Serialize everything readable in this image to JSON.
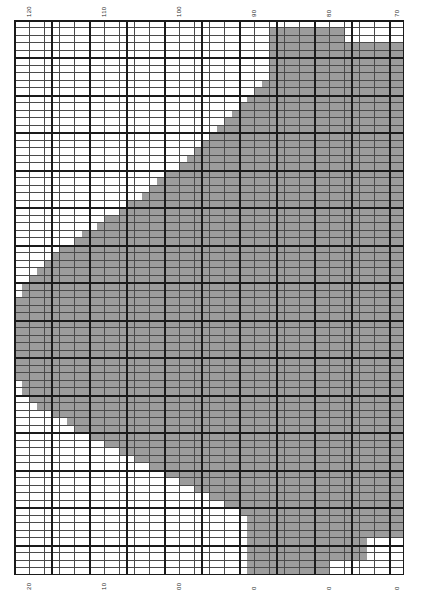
{
  "chart_data": {
    "type": "heatmap",
    "title": "",
    "xlabel": "",
    "ylabel": "",
    "grid": true,
    "legend": false,
    "cell_size_px": 7.5,
    "major_every": 5,
    "columns": 52,
    "rows": 74,
    "fill_color": "#9c9c9c",
    "background_color": "#ffffff",
    "minor_line_color": "#4a4a4a",
    "major_line_color": "#1a1a1a",
    "top_axis": {
      "position": "top",
      "orientation": "vertical",
      "ticks": [
        {
          "label": "120",
          "x_px": 26
        },
        {
          "label": "110",
          "x_px": 101
        },
        {
          "label": "100",
          "x_px": 176
        },
        {
          "label": "90",
          "x_px": 251
        },
        {
          "label": "80",
          "x_px": 326
        },
        {
          "label": "70",
          "x_px": 394
        }
      ]
    },
    "bottom_axis": {
      "position": "bottom",
      "orientation": "vertical",
      "ticks": [
        {
          "label": "20",
          "x_px": 26
        },
        {
          "label": "10",
          "x_px": 101
        },
        {
          "label": "00",
          "x_px": 176
        },
        {
          "label": "0",
          "x_px": 251
        },
        {
          "label": "0",
          "x_px": 326
        },
        {
          "label": "0",
          "x_px": 394
        }
      ]
    },
    "region_rows": [
      {
        "row": 0,
        "spans": []
      },
      {
        "row": 1,
        "spans": [
          [
            34,
            44
          ]
        ]
      },
      {
        "row": 2,
        "spans": [
          [
            34,
            44
          ]
        ]
      },
      {
        "row": 3,
        "spans": [
          [
            34,
            52
          ]
        ]
      },
      {
        "row": 4,
        "spans": [
          [
            34,
            52
          ]
        ]
      },
      {
        "row": 5,
        "spans": [
          [
            34,
            52
          ]
        ]
      },
      {
        "row": 6,
        "spans": [
          [
            34,
            52
          ]
        ]
      },
      {
        "row": 7,
        "spans": [
          [
            34,
            52
          ]
        ]
      },
      {
        "row": 8,
        "spans": [
          [
            33,
            52
          ]
        ]
      },
      {
        "row": 9,
        "spans": [
          [
            32,
            52
          ]
        ]
      },
      {
        "row": 10,
        "spans": [
          [
            31,
            52
          ]
        ]
      },
      {
        "row": 11,
        "spans": [
          [
            30,
            52
          ]
        ]
      },
      {
        "row": 12,
        "spans": [
          [
            29,
            52
          ]
        ]
      },
      {
        "row": 13,
        "spans": [
          [
            28,
            52
          ]
        ]
      },
      {
        "row": 14,
        "spans": [
          [
            27,
            52
          ]
        ]
      },
      {
        "row": 15,
        "spans": [
          [
            26,
            52
          ]
        ]
      },
      {
        "row": 16,
        "spans": [
          [
            25,
            52
          ]
        ]
      },
      {
        "row": 17,
        "spans": [
          [
            24,
            52
          ]
        ]
      },
      {
        "row": 18,
        "spans": [
          [
            23,
            52
          ]
        ]
      },
      {
        "row": 19,
        "spans": [
          [
            22,
            52
          ]
        ]
      },
      {
        "row": 20,
        "spans": [
          [
            20,
            52
          ]
        ]
      },
      {
        "row": 21,
        "spans": [
          [
            19,
            52
          ]
        ]
      },
      {
        "row": 22,
        "spans": [
          [
            18,
            52
          ]
        ]
      },
      {
        "row": 23,
        "spans": [
          [
            17,
            52
          ]
        ]
      },
      {
        "row": 24,
        "spans": [
          [
            15,
            52
          ]
        ]
      },
      {
        "row": 25,
        "spans": [
          [
            14,
            52
          ]
        ]
      },
      {
        "row": 26,
        "spans": [
          [
            12,
            52
          ]
        ]
      },
      {
        "row": 27,
        "spans": [
          [
            11,
            52
          ]
        ]
      },
      {
        "row": 28,
        "spans": [
          [
            9,
            52
          ]
        ]
      },
      {
        "row": 29,
        "spans": [
          [
            8,
            52
          ]
        ]
      },
      {
        "row": 30,
        "spans": [
          [
            6,
            52
          ]
        ]
      },
      {
        "row": 31,
        "spans": [
          [
            5,
            52
          ]
        ]
      },
      {
        "row": 32,
        "spans": [
          [
            4,
            52
          ]
        ]
      },
      {
        "row": 33,
        "spans": [
          [
            3,
            52
          ]
        ]
      },
      {
        "row": 34,
        "spans": [
          [
            2,
            52
          ]
        ]
      },
      {
        "row": 35,
        "spans": [
          [
            1,
            52
          ]
        ]
      },
      {
        "row": 36,
        "spans": [
          [
            1,
            52
          ]
        ]
      },
      {
        "row": 37,
        "spans": [
          [
            0,
            52
          ]
        ]
      },
      {
        "row": 38,
        "spans": [
          [
            0,
            52
          ]
        ]
      },
      {
        "row": 39,
        "spans": [
          [
            0,
            52
          ]
        ]
      },
      {
        "row": 40,
        "spans": [
          [
            0,
            52
          ]
        ]
      },
      {
        "row": 41,
        "spans": [
          [
            0,
            52
          ]
        ]
      },
      {
        "row": 42,
        "spans": [
          [
            0,
            52
          ]
        ]
      },
      {
        "row": 43,
        "spans": [
          [
            0,
            52
          ]
        ]
      },
      {
        "row": 44,
        "spans": [
          [
            0,
            52
          ]
        ]
      },
      {
        "row": 45,
        "spans": [
          [
            0,
            52
          ]
        ]
      },
      {
        "row": 46,
        "spans": [
          [
            0,
            52
          ]
        ]
      },
      {
        "row": 47,
        "spans": [
          [
            0,
            52
          ]
        ]
      },
      {
        "row": 48,
        "spans": [
          [
            1,
            52
          ]
        ]
      },
      {
        "row": 49,
        "spans": [
          [
            1,
            52
          ]
        ]
      },
      {
        "row": 50,
        "spans": [
          [
            2,
            52
          ]
        ]
      },
      {
        "row": 51,
        "spans": [
          [
            3,
            52
          ]
        ]
      },
      {
        "row": 52,
        "spans": [
          [
            5,
            52
          ]
        ]
      },
      {
        "row": 53,
        "spans": [
          [
            7,
            52
          ]
        ]
      },
      {
        "row": 54,
        "spans": [
          [
            8,
            52
          ]
        ]
      },
      {
        "row": 55,
        "spans": [
          [
            10,
            52
          ]
        ]
      },
      {
        "row": 56,
        "spans": [
          [
            12,
            52
          ]
        ]
      },
      {
        "row": 57,
        "spans": [
          [
            14,
            52
          ]
        ]
      },
      {
        "row": 58,
        "spans": [
          [
            16,
            52
          ]
        ]
      },
      {
        "row": 59,
        "spans": [
          [
            18,
            52
          ]
        ]
      },
      {
        "row": 60,
        "spans": [
          [
            20,
            52
          ]
        ]
      },
      {
        "row": 61,
        "spans": [
          [
            22,
            52
          ]
        ]
      },
      {
        "row": 62,
        "spans": [
          [
            24,
            52
          ]
        ]
      },
      {
        "row": 63,
        "spans": [
          [
            26,
            52
          ]
        ]
      },
      {
        "row": 64,
        "spans": [
          [
            28,
            52
          ]
        ]
      },
      {
        "row": 65,
        "spans": [
          [
            30,
            52
          ]
        ]
      },
      {
        "row": 66,
        "spans": [
          [
            31,
            52
          ]
        ]
      },
      {
        "row": 67,
        "spans": [
          [
            31,
            52
          ]
        ]
      },
      {
        "row": 68,
        "spans": [
          [
            31,
            52
          ]
        ]
      },
      {
        "row": 69,
        "spans": [
          [
            31,
            47
          ]
        ]
      },
      {
        "row": 70,
        "spans": [
          [
            31,
            47
          ]
        ]
      },
      {
        "row": 71,
        "spans": [
          [
            31,
            47
          ]
        ]
      },
      {
        "row": 72,
        "spans": [
          [
            31,
            42
          ]
        ]
      },
      {
        "row": 73,
        "spans": [
          [
            31,
            42
          ]
        ]
      }
    ]
  }
}
